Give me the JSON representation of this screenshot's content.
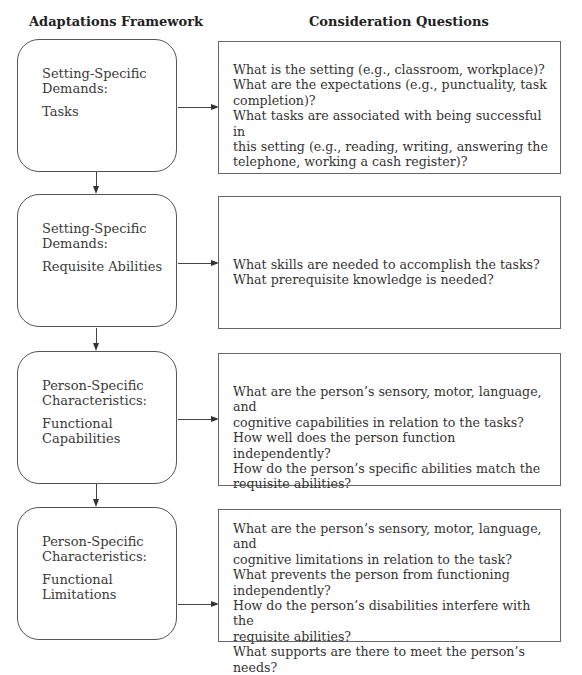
{
  "headers": {
    "left": "Adaptations Framework",
    "right": "Consideration Questions"
  },
  "stages": [
    {
      "category": [
        "Setting-Specific",
        "Demands:"
      ],
      "label": [
        "Tasks"
      ],
      "questions": [
        "What is the setting (e.g., classroom, workplace)?",
        "What are the expectations (e.g., punctuality, task",
        "completion)?",
        "What tasks are associated with being successful in",
        "this setting (e.g., reading, writing, answering the",
        "telephone, working a cash register)?"
      ]
    },
    {
      "category": [
        "Setting-Specific",
        "Demands:"
      ],
      "label": [
        "Requisite Abilities"
      ],
      "questions": [
        "What skills are needed to accomplish the tasks?",
        "What prerequisite knowledge is needed?"
      ]
    },
    {
      "category": [
        "Person-Specific",
        "Characteristics:"
      ],
      "label": [
        "Functional",
        "Capabilities"
      ],
      "questions": [
        "What are the person’s sensory, motor, language, and",
        "cognitive capabilities in relation to the tasks?",
        "How well does the person function independently?",
        "How do the person’s specific abilities match the",
        "requisite abilities?"
      ]
    },
    {
      "category": [
        "Person-Specific",
        "Characteristics:"
      ],
      "label": [
        "Functional",
        "Limitations"
      ],
      "questions": [
        "What are the person’s sensory, motor, language, and",
        "cognitive limitations in relation to the task?",
        "What prevents the person from functioning",
        "independently?",
        "How do the person’s disabilities interfere with the",
        "requisite abilities?",
        "What supports are there to meet the person’s needs?"
      ]
    }
  ]
}
